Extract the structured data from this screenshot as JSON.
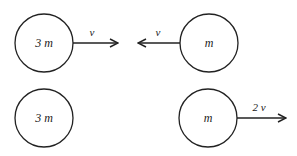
{
  "diagram": {
    "before": {
      "left_ball": {
        "mass_label": "3 m",
        "velocity_label": "v",
        "direction": "right"
      },
      "right_ball": {
        "mass_label": "m",
        "velocity_label": "v",
        "direction": "left"
      }
    },
    "after": {
      "left_ball": {
        "mass_label": "3 m"
      },
      "right_ball": {
        "mass_label": "m",
        "velocity_label": "2 v",
        "direction": "right"
      }
    },
    "colors": {
      "stroke": "#222222",
      "background": "#ffffff"
    }
  }
}
